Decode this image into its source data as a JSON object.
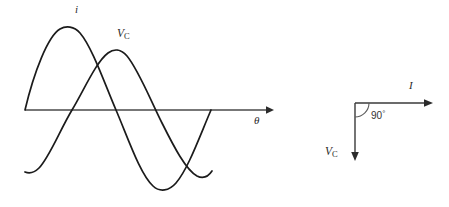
{
  "figure": {
    "kind": "physics-diagram",
    "background_color": "#ffffff",
    "line_color": "#1b1b1b",
    "axis_color": "#4a4a4a"
  },
  "waveform_panel": {
    "axis": {
      "label": "θ",
      "x_start": 25,
      "x_end": 272,
      "y": 110,
      "arrow": true
    },
    "curves": [
      {
        "name": "current",
        "label": "i",
        "label_x": 75,
        "label_y": 4,
        "phase_lead_deg": 90,
        "amplitude_px": 82,
        "peak_x": 70,
        "peak_y": 28,
        "zero_crossings_x": [
          25,
          163,
          212
        ]
      },
      {
        "name": "capacitor-voltage",
        "label": "V",
        "label_sub": "C",
        "label_x": 117,
        "label_y": 28,
        "phase_lead_deg": 0,
        "amplitude_px": 62,
        "peak_x": 116,
        "peak_y": 48,
        "zero_crossings_x": [
          76,
          210
        ]
      }
    ]
  },
  "phasor_panel": {
    "origin_x": 355,
    "origin_y": 103,
    "angle_label": "90",
    "angle_unit": "°",
    "vectors": [
      {
        "name": "current-phasor",
        "label": "I",
        "direction": "right",
        "tip_x": 432,
        "tip_y": 103,
        "label_x": 409,
        "label_y": 80
      },
      {
        "name": "capacitor-voltage-phasor",
        "label": "V",
        "label_sub": "C",
        "direction": "down",
        "tip_x": 355,
        "tip_y": 160,
        "label_x": 325,
        "label_y": 146
      }
    ]
  }
}
